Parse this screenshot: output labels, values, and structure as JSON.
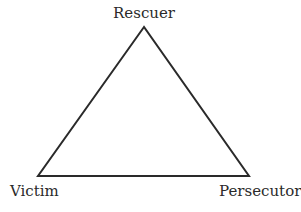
{
  "diagram": {
    "type": "triangle",
    "stroke_color": "#2a2a2a",
    "nodes": [
      {
        "id": "top",
        "label": "Rescuer"
      },
      {
        "id": "bottom_left",
        "label": "Victim"
      },
      {
        "id": "bottom_right",
        "label": "Persecutor"
      }
    ],
    "edges": [
      {
        "from": "Rescuer",
        "to": "Victim"
      },
      {
        "from": "Victim",
        "to": "Persecutor"
      },
      {
        "from": "Persecutor",
        "to": "Rescuer"
      }
    ]
  }
}
